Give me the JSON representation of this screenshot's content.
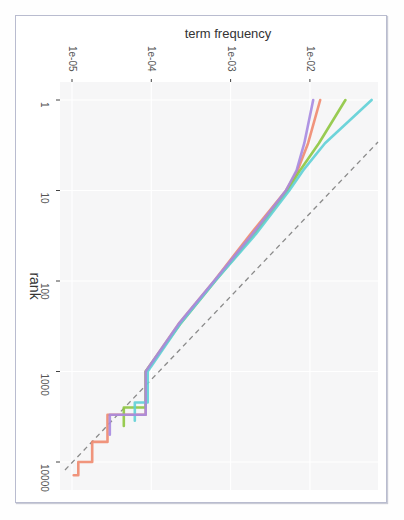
{
  "chart_data": {
    "type": "line",
    "title": "",
    "orientation_note": "figure rotated 90 degrees clockwise",
    "xlabel": "term frequency",
    "ylabel": "rank",
    "x_scale": "log10",
    "y_scale": "log10",
    "x_ticks": [
      "1e-05",
      "1e-04",
      "1e-03",
      "1e-02"
    ],
    "y_ticks": [
      "1",
      "10",
      "100",
      "1000",
      "10000"
    ],
    "xlim": [
      6e-06,
      0.09
    ],
    "ylim": [
      0.65,
      16000
    ],
    "grid": true,
    "legend": null,
    "reference_line": {
      "style": "dashed",
      "color": "#8a8a8a",
      "description": "fitted power-law (Zipf) line"
    },
    "series": [
      {
        "name": "series-1",
        "color": "#f08a6e",
        "points": [
          [
            1,
            0.0135
          ],
          [
            3,
            0.0095
          ],
          [
            6,
            0.007
          ],
          [
            10,
            0.005
          ],
          [
            30,
            0.0018
          ],
          [
            100,
            0.00062
          ],
          [
            300,
            0.00022
          ],
          [
            1000,
            8.5e-05
          ],
          [
            3000,
            2.8e-05
          ],
          [
            6000,
            1.8e-05
          ],
          [
            10000,
            1.2e-05
          ],
          [
            14000,
            1.05e-05
          ]
        ]
      },
      {
        "name": "series-2",
        "color": "#8ec63f",
        "points": [
          [
            1,
            0.028
          ],
          [
            3,
            0.013
          ],
          [
            6,
            0.0075
          ],
          [
            10,
            0.0052
          ],
          [
            30,
            0.002
          ],
          [
            100,
            0.00064
          ],
          [
            300,
            0.00023
          ],
          [
            1000,
            8.5e-05
          ],
          [
            2500,
            4.5e-05
          ],
          [
            4000,
            4.5e-05
          ]
        ]
      },
      {
        "name": "series-3",
        "color": "#5fd0d6",
        "points": [
          [
            1,
            0.06
          ],
          [
            3,
            0.0155
          ],
          [
            6,
            0.0082
          ],
          [
            10,
            0.0055
          ],
          [
            30,
            0.0021
          ],
          [
            100,
            0.00064
          ],
          [
            300,
            0.00023
          ],
          [
            1000,
            9e-05
          ],
          [
            2200,
            6.2e-05
          ],
          [
            3500,
            6.2e-05
          ]
        ]
      },
      {
        "name": "series-4",
        "color": "#a78ae0",
        "points": [
          [
            1,
            0.011
          ],
          [
            3,
            0.0085
          ],
          [
            6,
            0.0068
          ],
          [
            10,
            0.005
          ],
          [
            30,
            0.0019
          ],
          [
            100,
            0.00062
          ],
          [
            300,
            0.00022
          ],
          [
            1000,
            8.5e-05
          ],
          [
            3000,
            3e-05
          ],
          [
            5000,
            3e-05
          ]
        ]
      }
    ]
  }
}
